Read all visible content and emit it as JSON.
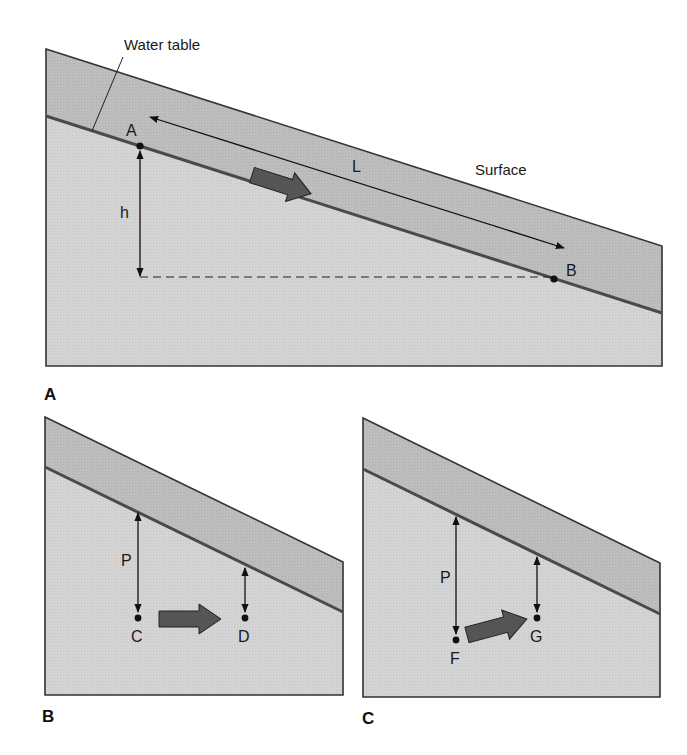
{
  "figure": {
    "panels": [
      {
        "id": "A",
        "panel_label": "A",
        "labels": {
          "water_table": "Water table",
          "surface": "Surface",
          "point_a": "A",
          "point_b": "B",
          "length": "L",
          "head": "h"
        }
      },
      {
        "id": "B",
        "panel_label": "B",
        "labels": {
          "pressure": "P",
          "point_c": "C",
          "point_d": "D"
        }
      },
      {
        "id": "C",
        "panel_label": "C",
        "labels": {
          "pressure": "P",
          "point_f": "F",
          "point_g": "G"
        }
      }
    ],
    "colors": {
      "unsaturated_zone": "#bdbdbd",
      "saturated_zone": "#d4d4d4",
      "outline": "#333333",
      "water_table_line": "#4a4a4a",
      "flow_arrow": "#555555",
      "background": "#ffffff"
    }
  }
}
